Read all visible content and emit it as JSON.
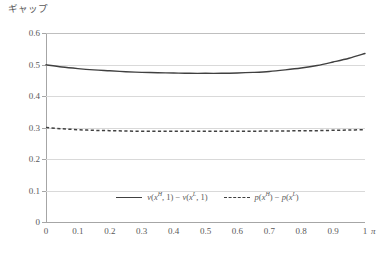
{
  "chart_data": {
    "type": "line",
    "title": "",
    "ylabel": "ギャップ",
    "xlabel": "π",
    "xlim": [
      0,
      1
    ],
    "ylim": [
      0,
      0.6
    ],
    "grid": true,
    "legend_position": "inside-bottom-center",
    "x_ticks": [
      "0",
      "0.1",
      "0.2",
      "0.3",
      "0.4",
      "0.5",
      "0.6",
      "0.7",
      "0.8",
      "0.9",
      "1"
    ],
    "x_tick_values": [
      0,
      0.1,
      0.2,
      0.3,
      0.4,
      0.5,
      0.6,
      0.7,
      0.8,
      0.9,
      1
    ],
    "y_ticks": [
      "0",
      "0.1",
      "0.2",
      "0.3",
      "0.4",
      "0.5",
      "0.6"
    ],
    "y_tick_values": [
      0,
      0.1,
      0.2,
      0.3,
      0.4,
      0.5,
      0.6
    ],
    "x": [
      0,
      0.05,
      0.1,
      0.15,
      0.2,
      0.25,
      0.3,
      0.35,
      0.4,
      0.45,
      0.5,
      0.55,
      0.6,
      0.65,
      0.7,
      0.75,
      0.8,
      0.85,
      0.9,
      0.95,
      1
    ],
    "series": [
      {
        "name": "v(x^H, 1) - v(x^L, 1)",
        "style": "solid",
        "color": "#404040",
        "values": [
          0.499,
          0.492,
          0.487,
          0.483,
          0.48,
          0.477,
          0.475,
          0.474,
          0.473,
          0.472,
          0.472,
          0.472,
          0.473,
          0.475,
          0.478,
          0.483,
          0.489,
          0.497,
          0.508,
          0.52,
          0.535
        ]
      },
      {
        "name": "p(x^H) - p(x^L)",
        "style": "dashed",
        "color": "#404040",
        "values": [
          0.3,
          0.296,
          0.293,
          0.291,
          0.29,
          0.289,
          0.288,
          0.288,
          0.288,
          0.288,
          0.288,
          0.288,
          0.288,
          0.288,
          0.289,
          0.289,
          0.29,
          0.29,
          0.291,
          0.292,
          0.293
        ]
      }
    ]
  },
  "legend": {
    "entries": [
      {
        "label_plain": "v(xH, 1) - v(xL, 1)",
        "style": "solid"
      },
      {
        "label_plain": "p(xH) - p(xL)",
        "style": "dashed"
      }
    ]
  },
  "colors": {
    "line": "#404040",
    "gridline": "#d9d9d9",
    "axis": "#a6a6a6",
    "text": "#595959",
    "background": "#ffffff"
  }
}
